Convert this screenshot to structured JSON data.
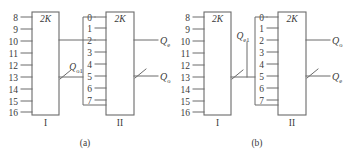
{
  "figure": {
    "panels": [
      {
        "caption": "(a)",
        "chips": [
          {
            "roman": "I",
            "type_label": "2K",
            "pins": [
              "8",
              "9",
              "10",
              "11",
              "12",
              "13",
              "14",
              "15",
              "16"
            ],
            "pin_side": "left"
          },
          {
            "roman": "II",
            "type_label": "2K",
            "pins": [
              "0",
              "1",
              "2",
              "3",
              "4",
              "5",
              "6",
              "7"
            ],
            "pin_side": "left"
          }
        ],
        "interconnect_label": "Q",
        "interconnect_sub": "o1",
        "outputs": [
          {
            "symbol": "Q",
            "sub": "e"
          },
          {
            "symbol": "Q",
            "sub": "o"
          }
        ]
      },
      {
        "caption": "(b)",
        "chips": [
          {
            "roman": "I",
            "type_label": "2K",
            "pins": [
              "8",
              "9",
              "10",
              "11",
              "12",
              "13",
              "14",
              "15",
              "16"
            ],
            "pin_side": "left"
          },
          {
            "roman": "II",
            "type_label": "2K",
            "pins": [
              "0",
              "1",
              "2",
              "3",
              "4",
              "5",
              "6",
              "7"
            ],
            "pin_side": "left"
          }
        ],
        "interconnect_label": "Q",
        "interconnect_sub": "e1",
        "outputs": [
          {
            "symbol": "Q",
            "sub": "o"
          },
          {
            "symbol": "Q",
            "sub": "e"
          }
        ]
      }
    ],
    "colors": {
      "line": "#6b6b6b",
      "text": "#3a3a3a",
      "background": "#ffffff"
    }
  }
}
